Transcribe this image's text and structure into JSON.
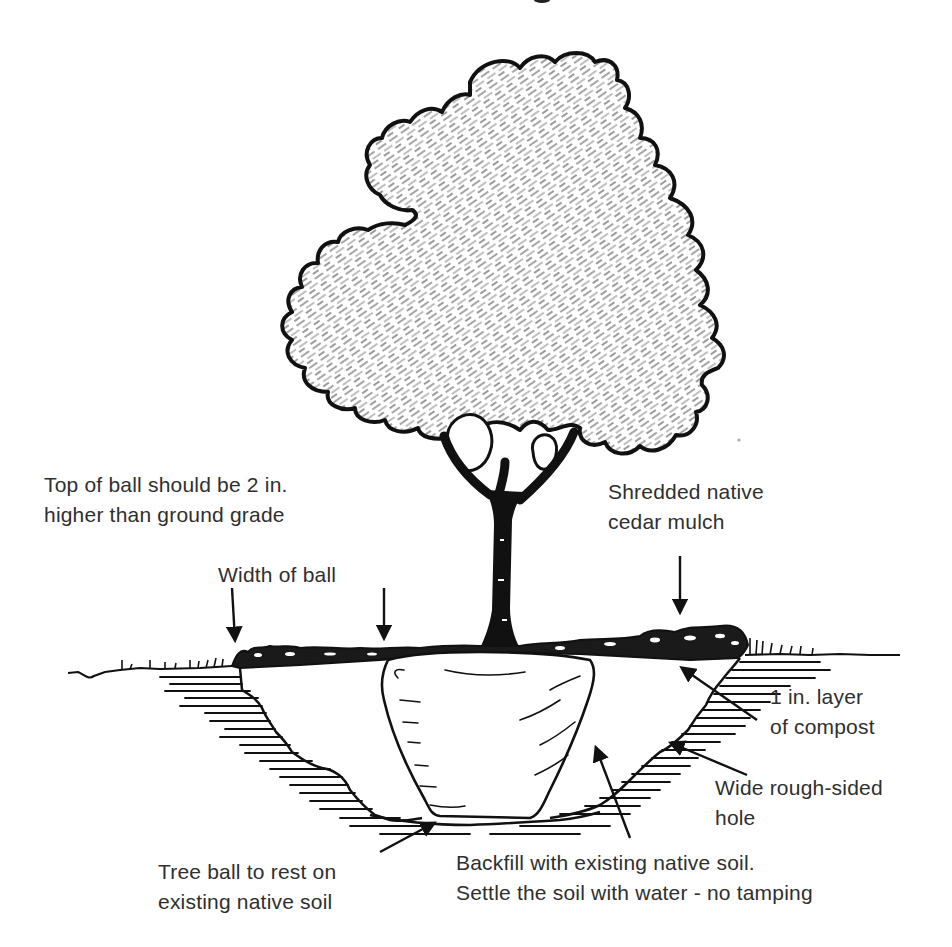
{
  "diagram": {
    "type": "tree-planting-cross-section",
    "elements": [
      "tree canopy",
      "trunk",
      "root ball",
      "planting hole",
      "mulch layer",
      "compost layer",
      "ground grade"
    ]
  },
  "labels": {
    "top_of_ball": {
      "line1": "Top of ball should be 2 in.",
      "line2": "higher than ground grade"
    },
    "mulch": {
      "line1": "Shredded native",
      "line2": "cedar mulch"
    },
    "width_of_ball": {
      "line1": "Width of ball"
    },
    "compost": {
      "line1": "1 in. layer",
      "line2": "of compost"
    },
    "hole": {
      "line1": "Wide rough-sided",
      "line2": "hole"
    },
    "tree_ball": {
      "line1": "Tree ball to rest on",
      "line2": "existing native soil"
    },
    "backfill": {
      "line1": "Backfill with existing native soil.",
      "line2": "Settle the soil with water - no tamping"
    }
  },
  "colors": {
    "ink": "#111111",
    "text": "#2f2f2f",
    "canopy_hatch": "#8a8a8a",
    "background": "#ffffff"
  }
}
